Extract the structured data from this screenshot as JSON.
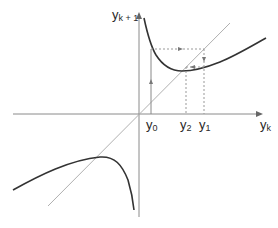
{
  "diagram": {
    "type": "cobweb-iteration-plot",
    "axes": {
      "x_label": "y",
      "x_label_sub": "k",
      "y_label": "y",
      "y_label_sub": "k + 1"
    },
    "points": {
      "y0": {
        "label": "y",
        "sub": "0"
      },
      "y2": {
        "label": "y",
        "sub": "2"
      },
      "y1": {
        "label": "y",
        "sub": "1"
      }
    },
    "elements": [
      "x-axis with arrow",
      "y-axis with arrow",
      "identity diagonal line y_{k+1} = y_k",
      "upper-right hyperbolic branch of iteration function",
      "lower-left branch of iteration function",
      "cobweb path: vertical from y0 up to curve, horizontal to diagonal, down to curve, left to diagonal"
    ],
    "colors": {
      "curve": "#333333",
      "axis": "#888888",
      "diagonal": "#aaaaaa",
      "cobweb": "#888888",
      "text": "#2a2a2a"
    }
  }
}
